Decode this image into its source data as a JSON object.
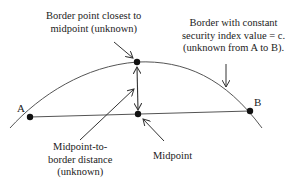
{
  "diagram": {
    "colors": {
      "line": "#555555",
      "dot": "#111111",
      "text": "#222222",
      "background": "#ffffff"
    },
    "points": {
      "a": {
        "label": "A"
      },
      "b": {
        "label": "B"
      }
    },
    "labels": {
      "border_point": {
        "line1": "Border point closest to",
        "line2": "midpoint (unknown)"
      },
      "border_curve": {
        "line1": "Border with constant",
        "line2": "security index value = c.",
        "line3": "(unknown from A to B)."
      },
      "distance": {
        "line1": "Midpoint-to-",
        "line2": "border distance",
        "line3": "(unknown)"
      },
      "midpoint": {
        "line1": "Midpoint"
      }
    }
  }
}
